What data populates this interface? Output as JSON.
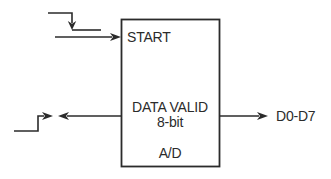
{
  "diagram": {
    "background_color": "#ffffff",
    "line_color": "#2b2b2b",
    "block": {
      "input_label": "START",
      "data_valid_label": "DATA VALID",
      "width_label": "8-bit",
      "device_label": "A/D"
    },
    "bus_label": "D0-D7",
    "icons": {
      "falling_edge": "falling-edge-waveform-icon",
      "rising_edge": "rising-edge-waveform-icon"
    }
  }
}
